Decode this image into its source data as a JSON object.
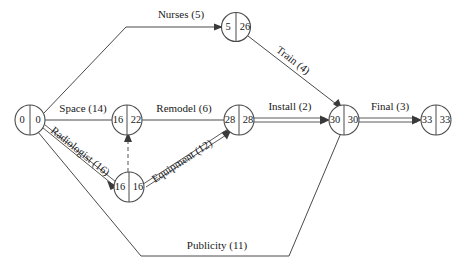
{
  "diagram": {
    "type": "activity-on-arrow-network",
    "nodes": [
      {
        "id": "n0",
        "early": "0",
        "late": "0",
        "cx": 30,
        "cy": 120
      },
      {
        "id": "n1",
        "early": "5",
        "late": "26",
        "cx": 236,
        "cy": 27
      },
      {
        "id": "n2",
        "early": "16",
        "late": "22",
        "cx": 127,
        "cy": 120
      },
      {
        "id": "n3",
        "early": "16",
        "late": "16",
        "cx": 129,
        "cy": 187
      },
      {
        "id": "n4",
        "early": "28",
        "late": "28",
        "cx": 239,
        "cy": 120
      },
      {
        "id": "n5",
        "early": "30",
        "late": "30",
        "cx": 344,
        "cy": 120
      },
      {
        "id": "n6",
        "early": "33",
        "late": "33",
        "cx": 436,
        "cy": 120
      }
    ],
    "edges": [
      {
        "id": "e-nurses",
        "label": "Nurses (5)",
        "from": "n0",
        "to": "n1",
        "style": "single",
        "duration": 5
      },
      {
        "id": "e-space",
        "label": "Space (14)",
        "from": "n0",
        "to": "n2",
        "style": "single",
        "duration": 14
      },
      {
        "id": "e-radiologist",
        "label": "Radiologist (16)",
        "from": "n0",
        "to": "n3",
        "style": "double",
        "duration": 16
      },
      {
        "id": "e-publicity",
        "label": "Publicity (11)",
        "from": "n0",
        "to": "n5",
        "style": "single",
        "duration": 11
      },
      {
        "id": "e-remodel",
        "label": "Remodel (6)",
        "from": "n2",
        "to": "n4",
        "style": "single",
        "duration": 6
      },
      {
        "id": "e-equipment",
        "label": "Equipment (12)",
        "from": "n3",
        "to": "n4",
        "style": "double",
        "duration": 12
      },
      {
        "id": "e-dummy",
        "label": "",
        "from": "n3",
        "to": "n2",
        "style": "dashed",
        "duration": 0
      },
      {
        "id": "e-train",
        "label": "Train (4)",
        "from": "n1",
        "to": "n5",
        "style": "single",
        "duration": 4
      },
      {
        "id": "e-install",
        "label": "Install (2)",
        "from": "n4",
        "to": "n5",
        "style": "double",
        "duration": 2
      },
      {
        "id": "e-final",
        "label": "Final (3)",
        "from": "n5",
        "to": "n6",
        "style": "double",
        "duration": 3
      }
    ],
    "colors": {
      "line": "#4a4a4a",
      "text": "#1a1a1a",
      "background": "#ffffff"
    }
  }
}
